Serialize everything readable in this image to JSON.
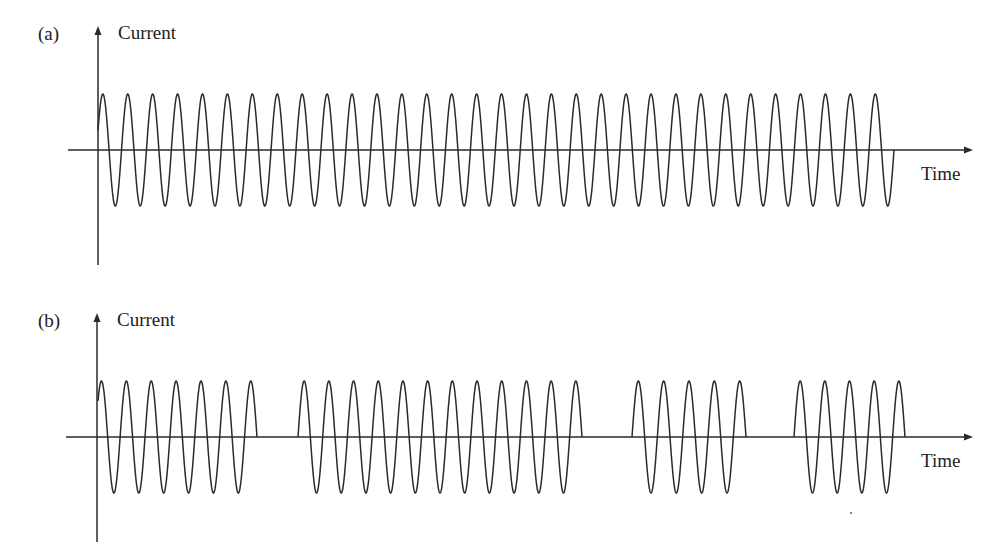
{
  "figure": {
    "panels": [
      {
        "id": "a",
        "panel_label": "(a)",
        "y_axis_label": "Current",
        "x_axis_label": "Time",
        "description": "Continuous sinusoidal current",
        "bursts": [
          {
            "start_x": 98,
            "end_x": 894,
            "peaks": 32
          }
        ]
      },
      {
        "id": "b",
        "panel_label": "(b)",
        "y_axis_label": "Current",
        "x_axis_label": "Time",
        "description": "Pulsed (burst) sinusoidal current",
        "bursts": [
          {
            "start_x": 98,
            "end_x": 257,
            "peaks": 7
          },
          {
            "start_x": 298,
            "end_x": 582,
            "peaks": 12
          },
          {
            "start_x": 632,
            "end_x": 746,
            "peaks": 5
          },
          {
            "start_x": 794,
            "end_x": 905,
            "peaks": 5
          }
        ]
      }
    ]
  },
  "colors": {
    "line": "#2a2a2a",
    "text": "#222222",
    "background": "#ffffff"
  }
}
